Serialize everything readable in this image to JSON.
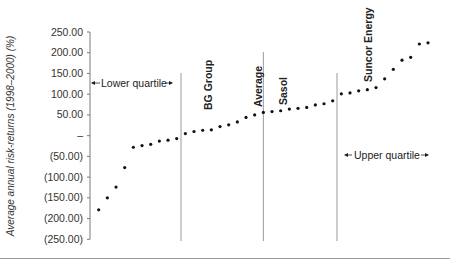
{
  "chart_data": {
    "type": "scatter",
    "title": "",
    "xlabel": "",
    "ylabel": "Average annual risk-returns (1998–2000) (%)",
    "ylim": [
      -250,
      250
    ],
    "y_ticks": [
      250,
      200,
      150,
      100,
      50,
      0,
      -50,
      -100,
      -150,
      -200,
      -250
    ],
    "y_tick_labels": [
      "250.00",
      "200.00",
      "150.00",
      "100.00",
      "50.00",
      "–",
      "(50.00)",
      "(100.00)",
      "(150.00)",
      "(200.00)",
      "(250.00)"
    ],
    "grid": false,
    "legend": null,
    "x": [
      1,
      2,
      3,
      4,
      5,
      6,
      7,
      8,
      9,
      10,
      11,
      12,
      13,
      14,
      15,
      16,
      17,
      18,
      19,
      20,
      21,
      22,
      23,
      24,
      25,
      26,
      27,
      28,
      29,
      30,
      31,
      32,
      33,
      34,
      35,
      36,
      37,
      38,
      39
    ],
    "values": [
      -179,
      -150,
      -124,
      -77,
      -28,
      -24,
      -21,
      -13,
      -11,
      -7,
      5,
      10,
      13,
      14,
      22,
      26,
      33,
      44,
      50,
      56,
      58,
      60,
      64,
      66,
      68,
      74,
      77,
      84,
      101,
      103,
      108,
      111,
      116,
      137,
      160,
      182,
      189,
      221,
      224
    ],
    "reference_lines": [
      {
        "name": "lower-quartile",
        "after_index": 10
      },
      {
        "name": "average",
        "after_index": 19
      },
      {
        "name": "upper-quartile",
        "after_index": 28
      }
    ],
    "annotations": [
      {
        "text": "Lower quartile",
        "type": "range-label"
      },
      {
        "text": "Upper quartile",
        "type": "range-label"
      },
      {
        "text": "BG Group",
        "point_index": 13
      },
      {
        "text": "Average",
        "position": "line"
      },
      {
        "text": "Sasol",
        "point_index": 21
      },
      {
        "text": "Suncor Energy",
        "point_index": 31
      }
    ]
  },
  "labels": {
    "ylabel": "Average annual risk-returns (1998–2000) (%)",
    "lower_quartile": "Lower quartile",
    "upper_quartile": "Upper quartile",
    "bg_group": "BG Group",
    "average": "Average",
    "sasol": "Sasol",
    "suncor": "Suncor Energy"
  },
  "colors": {
    "points": "#111111",
    "axis": "#7a7a7a",
    "ref_lines": "#9a9a9a"
  }
}
